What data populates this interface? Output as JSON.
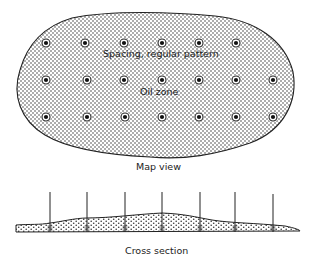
{
  "map_view": {
    "caption": "Map view",
    "label_spacing": "Spacing, regular pattern",
    "label_zone": "Oil zone",
    "well_rows": [
      {
        "y": 43,
        "x": [
          46,
          85,
          124,
          162,
          199,
          236
        ]
      },
      {
        "y": 80,
        "x": [
          46,
          87,
          124,
          162,
          199,
          236,
          273
        ]
      },
      {
        "y": 117,
        "x": [
          46,
          87,
          125,
          162,
          199,
          236,
          273
        ]
      }
    ],
    "well_icon": "well-symbol-icon"
  },
  "cross_section": {
    "caption": "Cross section",
    "wells_x": [
      50,
      87,
      125,
      162,
      200,
      235,
      273
    ],
    "well_icon": "well-bore-icon"
  }
}
